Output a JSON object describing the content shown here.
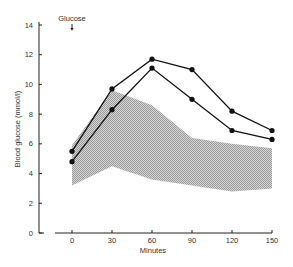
{
  "chart_data": {
    "type": "line",
    "title": "",
    "xlabel": "Minutes",
    "ylabel": "Blood glucose (mmol/l)",
    "annotation": {
      "text": "Glucose",
      "x": 0,
      "marker": "down-arrow"
    },
    "x": [
      0,
      30,
      60,
      90,
      120,
      150
    ],
    "xticks": [
      "0",
      "30",
      "60",
      "90",
      "120",
      "150"
    ],
    "yticks": [
      "0",
      "2",
      "4",
      "6",
      "8",
      "10",
      "12",
      "14"
    ],
    "xlim": [
      0,
      150
    ],
    "ylim": [
      0,
      14
    ],
    "grid": false,
    "series": [
      {
        "name": "Patient curve A",
        "values": [
          5.5,
          9.7,
          11.7,
          11.0,
          8.2,
          6.9
        ]
      },
      {
        "name": "Patient curve B",
        "values": [
          4.8,
          8.3,
          11.1,
          9.0,
          6.9,
          6.3
        ]
      }
    ],
    "normal_range": {
      "name": "Normal range (shaded)",
      "upper": [
        5.9,
        9.6,
        8.6,
        6.4,
        6.0,
        5.7
      ],
      "lower": [
        3.2,
        4.5,
        3.6,
        3.2,
        2.8,
        3.0
      ]
    }
  }
}
